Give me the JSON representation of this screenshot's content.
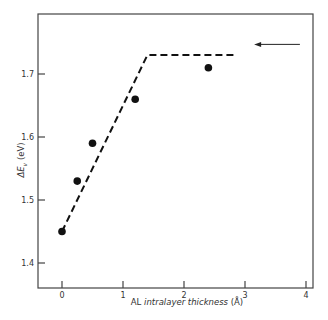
{
  "chart_data": {
    "type": "scatter",
    "title": "",
    "xlabel": "AL intralayer thickness (Å)",
    "xlabel_parts": {
      "prefix": "AL ",
      "italic": "intralayer thickness",
      "suffix": " (Å)"
    },
    "ylabel": "ΔE_v (eV)",
    "ylabel_parts": {
      "delta": "ΔE",
      "sub": "v",
      "unit": " (eV)"
    },
    "xlim": [
      -0.4,
      4.15
    ],
    "ylim": [
      1.36,
      1.78
    ],
    "x_ticks": [
      0,
      1,
      2,
      3,
      4
    ],
    "x_tick_labels": [
      "0",
      "1",
      "2",
      "3",
      "4"
    ],
    "y_ticks": [
      1.4,
      1.5,
      1.6,
      1.7
    ],
    "y_tick_labels": [
      "1.4",
      "1.5",
      "1.6",
      "1.7"
    ],
    "grid": false,
    "series": [
      {
        "name": "measured",
        "style": "filled-circle",
        "x": [
          0.0,
          0.25,
          0.5,
          1.2,
          2.4
        ],
        "y": [
          1.45,
          1.53,
          1.59,
          1.66,
          1.71
        ]
      },
      {
        "name": "model",
        "style": "dashed-line",
        "x": [
          0.0,
          1.4,
          2.85
        ],
        "y": [
          1.45,
          1.73,
          1.73
        ]
      }
    ],
    "annotations": [
      {
        "type": "arrow",
        "direction": "left",
        "x_from": 3.9,
        "x_to": 3.15,
        "y": 1.747
      }
    ]
  }
}
